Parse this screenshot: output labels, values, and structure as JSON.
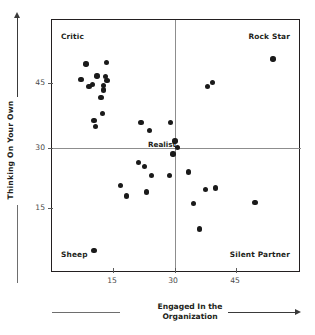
{
  "chart_data": {
    "type": "scatter",
    "title": "",
    "xlabel_line1": "Engaged In the",
    "xlabel_line2": "Organization",
    "ylabel": "Thinking On Your Own",
    "xlim": [
      5,
      56
    ],
    "ylim": [
      6,
      56
    ],
    "xticks": [
      15,
      30,
      45
    ],
    "yticks": [
      15,
      30,
      45
    ],
    "xtick_labels": [
      "15",
      "30",
      "45"
    ],
    "ytick_labels": [
      "15",
      "30",
      "45"
    ],
    "grid": false,
    "legend": "none",
    "crosshair_x": 30,
    "crosshair_y": 30,
    "quadrant_labels": {
      "top_left": "Critic",
      "top_right": "Rock Star",
      "bottom_left": "Sheep",
      "bottom_right": "Silent Partner",
      "center": "Realist"
    },
    "points": [
      {
        "x": 12.0,
        "y": 47.3
      },
      {
        "x": 16.2,
        "y": 47.6
      },
      {
        "x": 10.9,
        "y": 44.2
      },
      {
        "x": 14.2,
        "y": 44.9
      },
      {
        "x": 16.0,
        "y": 44.8
      },
      {
        "x": 16.3,
        "y": 44.0
      },
      {
        "x": 13.3,
        "y": 43.2
      },
      {
        "x": 15.6,
        "y": 43.1
      },
      {
        "x": 12.6,
        "y": 42.8
      },
      {
        "x": 15.6,
        "y": 42.2
      },
      {
        "x": 15.0,
        "y": 40.7
      },
      {
        "x": 15.3,
        "y": 37.5
      },
      {
        "x": 13.6,
        "y": 36.2
      },
      {
        "x": 13.9,
        "y": 34.9
      },
      {
        "x": 23.2,
        "y": 35.7
      },
      {
        "x": 29.3,
        "y": 35.8
      },
      {
        "x": 25.0,
        "y": 34.2
      },
      {
        "x": 30.2,
        "y": 32.1
      },
      {
        "x": 30.7,
        "y": 30.8
      },
      {
        "x": 29.8,
        "y": 29.5
      },
      {
        "x": 22.7,
        "y": 27.8
      },
      {
        "x": 24.0,
        "y": 27.0
      },
      {
        "x": 25.4,
        "y": 25.3
      },
      {
        "x": 29.1,
        "y": 25.3
      },
      {
        "x": 32.9,
        "y": 26.0
      },
      {
        "x": 19.0,
        "y": 23.3
      },
      {
        "x": 24.3,
        "y": 22.0
      },
      {
        "x": 20.2,
        "y": 21.2
      },
      {
        "x": 36.4,
        "y": 22.5
      },
      {
        "x": 38.5,
        "y": 22.8
      },
      {
        "x": 34.0,
        "y": 19.7
      },
      {
        "x": 46.6,
        "y": 19.9
      },
      {
        "x": 35.2,
        "y": 14.7
      },
      {
        "x": 36.8,
        "y": 42.8
      },
      {
        "x": 37.9,
        "y": 43.6
      },
      {
        "x": 50.3,
        "y": 48.3
      },
      {
        "x": 13.6,
        "y": 10.5
      }
    ],
    "marker": {
      "shape": "circle",
      "color": "#1a1a1a",
      "size_px": 5.4
    },
    "frame_color": "#231f20",
    "crosshair_color": "#8d8d8d",
    "background": "#ffffff"
  }
}
